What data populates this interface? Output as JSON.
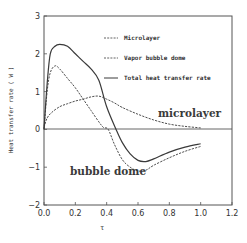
{
  "chart_data": {
    "type": "line",
    "title": "",
    "xlabel": "τ",
    "ylabel": "Heat transfer rate ( W )",
    "xlim": [
      0.0,
      1.2
    ],
    "ylim": [
      -2,
      3
    ],
    "x_ticks": [
      "0.0",
      "0.2",
      "0.4",
      "0.6",
      "0.8",
      "1.0",
      "1.2"
    ],
    "y_ticks": [
      "3",
      "2",
      "1",
      "0",
      "−1",
      "−2"
    ],
    "grid": false,
    "legend_position": "upper right",
    "legend": [
      "Microlayer",
      "Vapor bubble dome",
      "Total heat transfer rate"
    ],
    "annotations": [
      "microlayer",
      "bubble dome"
    ],
    "series": [
      {
        "name": "Microlayer",
        "style": "dashed",
        "x": [
          0.0,
          0.02,
          0.05,
          0.1,
          0.15,
          0.2,
          0.25,
          0.3,
          0.35,
          0.4,
          0.45,
          0.5,
          0.6,
          0.7,
          0.8,
          0.9,
          1.0
        ],
        "values": [
          0.05,
          0.3,
          0.45,
          0.6,
          0.68,
          0.75,
          0.8,
          0.86,
          0.88,
          0.8,
          0.7,
          0.58,
          0.4,
          0.25,
          0.14,
          0.08,
          0.04
        ]
      },
      {
        "name": "Vapor bubble dome",
        "style": "dashed",
        "x": [
          0.0,
          0.02,
          0.04,
          0.07,
          0.1,
          0.15,
          0.2,
          0.25,
          0.3,
          0.35,
          0.38,
          0.41,
          0.45,
          0.5,
          0.55,
          0.6,
          0.65,
          0.7,
          0.8,
          0.9,
          1.0
        ],
        "values": [
          0.0,
          1.0,
          1.5,
          1.68,
          1.6,
          1.35,
          1.1,
          0.8,
          0.5,
          0.2,
          0.05,
          0.0,
          -0.4,
          -0.8,
          -1.0,
          -1.1,
          -1.08,
          -0.95,
          -0.75,
          -0.58,
          -0.45
        ]
      },
      {
        "name": "Total heat transfer rate",
        "style": "solid",
        "x": [
          0.0,
          0.02,
          0.04,
          0.07,
          0.1,
          0.15,
          0.2,
          0.25,
          0.3,
          0.35,
          0.4,
          0.46,
          0.5,
          0.55,
          0.6,
          0.65,
          0.7,
          0.8,
          0.9,
          1.0
        ],
        "values": [
          0.0,
          1.2,
          2.0,
          2.2,
          2.25,
          2.2,
          2.0,
          1.8,
          1.6,
          1.3,
          0.6,
          0.0,
          -0.35,
          -0.65,
          -0.82,
          -0.85,
          -0.78,
          -0.6,
          -0.47,
          -0.38
        ]
      }
    ]
  },
  "colors": {
    "line": "#3a3a3a",
    "axis": "#555555",
    "background": "#ffffff"
  }
}
